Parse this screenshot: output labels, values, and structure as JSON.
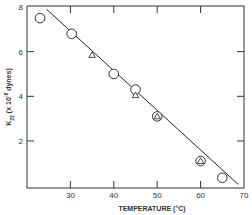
{
  "chart_data": {
    "type": "scatter",
    "title": "",
    "xlabel": "TEMPERATURE (°C)",
    "ylabel": "K22 (x 10^-8 dynes)",
    "ylabel_parts": {
      "symbol": "K",
      "sub": "22",
      "pre": " (x 10",
      "sup": "-8",
      "post": " dynes)"
    },
    "xlim": [
      20,
      70
    ],
    "ylim": [
      0,
      8
    ],
    "xticks": [
      30,
      40,
      50,
      60,
      70
    ],
    "xtick_labels": [
      "30",
      "40",
      "50",
      "60",
      "70"
    ],
    "yticks": [
      2,
      4,
      6,
      8
    ],
    "ytick_labels": [
      "2",
      "4",
      "6",
      "8"
    ],
    "grid": false,
    "legend": null,
    "series": [
      {
        "name": "circles",
        "marker": "circle",
        "points": [
          {
            "x": 23,
            "y": 7.5
          },
          {
            "x": 30.3,
            "y": 6.8
          },
          {
            "x": 40,
            "y": 5.0
          },
          {
            "x": 45,
            "y": 4.3
          },
          {
            "x": 50,
            "y": 3.1
          },
          {
            "x": 60,
            "y": 1.1
          },
          {
            "x": 65,
            "y": 0.35
          }
        ]
      },
      {
        "name": "triangles",
        "marker": "triangle",
        "points": [
          {
            "x": 35,
            "y": 5.85
          },
          {
            "x": 45,
            "y": 4.05
          },
          {
            "x": 50,
            "y": 3.1
          },
          {
            "x": 60,
            "y": 1.1
          }
        ]
      }
    ],
    "fit_line": {
      "x1": 24.5,
      "y1": 7.9,
      "x2": 68.7,
      "y2": 0.05
    }
  }
}
